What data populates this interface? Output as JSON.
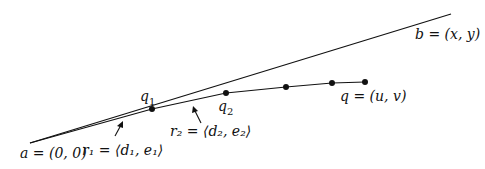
{
  "diagram": {
    "line_color": "#111111",
    "points": {
      "a": {
        "label": "a = (0, 0)",
        "x": 30,
        "y": 143
      },
      "b_end": {
        "label": "b = (x, y)",
        "x": 451,
        "y": 14
      },
      "path": [
        {
          "x": 30,
          "y": 143
        },
        {
          "x": 152,
          "y": 109
        },
        {
          "x": 226,
          "y": 93
        },
        {
          "x": 286,
          "y": 87
        },
        {
          "x": 332,
          "y": 83
        },
        {
          "x": 365,
          "y": 82
        }
      ]
    },
    "labels": {
      "a": "a = (0, 0)",
      "b": "b = (x, y)",
      "q1": "q",
      "q1_sub": "1",
      "q2": "q",
      "q2_sub": "2",
      "q": "q = (u, v)",
      "r1": "r₁ = ⟨d₁, e₁⟩",
      "r2": "r₂ = ⟨d₂, e₂⟩"
    }
  }
}
